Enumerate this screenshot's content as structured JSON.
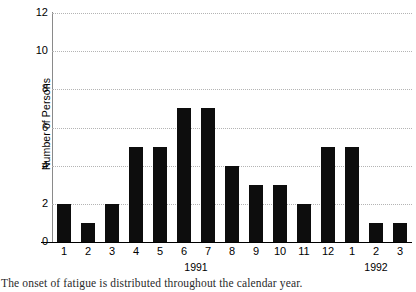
{
  "chart_data": {
    "type": "bar",
    "title": "",
    "xlabel": "",
    "ylabel": "Number of Persons",
    "categories": [
      "1",
      "2",
      "3",
      "4",
      "5",
      "6",
      "7",
      "8",
      "9",
      "10",
      "11",
      "12",
      "1",
      "2",
      "3"
    ],
    "values": [
      2,
      1,
      2,
      5,
      5,
      7,
      7,
      4,
      3,
      3,
      2,
      5,
      5,
      1,
      1
    ],
    "ylim": [
      0,
      12
    ],
    "yticks": [
      0,
      2,
      4,
      6,
      8,
      10,
      12
    ],
    "ytick_labels": [
      "0",
      "2",
      "4",
      "6",
      "8",
      "10",
      "12"
    ],
    "grid": true,
    "grid_axis": "y",
    "legend": "none",
    "bar_color": "#0d0d0d",
    "grid_color": "#b4b4b4",
    "axis_color": "#000000",
    "group_labels": [
      {
        "label": "1991",
        "spans": [
          "1",
          "2",
          "3",
          "4",
          "5",
          "6",
          "7",
          "8",
          "9",
          "10",
          "11",
          "12"
        ]
      },
      {
        "label": "1992",
        "spans": [
          "1",
          "2",
          "3"
        ]
      }
    ]
  },
  "caption": {
    "text": "The onset of fatigue is distributed throughout the calendar year."
  }
}
